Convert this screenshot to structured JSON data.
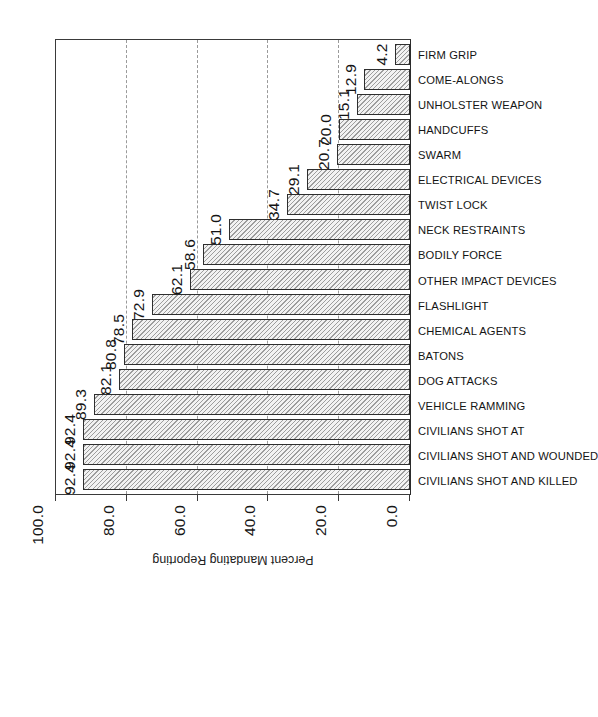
{
  "chart_data": {
    "type": "bar",
    "title": "",
    "subtitle": "",
    "xlabel": "",
    "ylabel": "Percent Mandating Reporting",
    "ylim": [
      0.0,
      100.0
    ],
    "yticks": [
      "0.0",
      "20.0",
      "40.0",
      "60.0",
      "80.0",
      "100.0"
    ],
    "ytick_values": [
      0.0,
      20.0,
      40.0,
      60.0,
      80.0,
      100.0
    ],
    "grid": "horizontal-dashed",
    "gridline_values": [
      20.0,
      40.0,
      60.0,
      80.0
    ],
    "legend": "none",
    "orientation": "page-rotated-90-ccw",
    "categories": [
      "CIVILIANS SHOT AND KILLED",
      "CIVILIANS SHOT AND WOUNDED",
      "CIVILIANS SHOT AT",
      "VEHICLE RAMMING",
      "DOG ATTACKS",
      "BATONS",
      "CHEMICAL AGENTS",
      "FLASHLIGHT",
      "OTHER IMPACT DEVICES",
      "BODILY FORCE",
      "NECK RESTRAINTS",
      "TWIST LOCK",
      "ELECTRICAL DEVICES",
      "SWARM",
      "HANDCUFFS",
      "UNHOLSTER WEAPON",
      "COME-ALONGS",
      "FIRM GRIP"
    ],
    "values": [
      92.4,
      92.4,
      92.4,
      89.3,
      82.1,
      80.8,
      78.5,
      72.9,
      62.1,
      58.6,
      51.0,
      34.7,
      29.1,
      20.7,
      20.0,
      15.1,
      12.9,
      4.2
    ],
    "value_labels": [
      "92.4",
      "92.4",
      "92.4",
      "89.3",
      "82.1",
      "80.8",
      "78.5",
      "72.9",
      "62.1",
      "58.6",
      "51.0",
      "34.7",
      "29.1",
      "20.7",
      "20.0",
      "15.1",
      "12.9",
      "4.2"
    ],
    "bar_fill": "#f2f2f2",
    "bar_hatch": "diagonal",
    "bar_edge": "#2e2e2e",
    "grid_color": "#9a9a9a",
    "axis_color": "#3a3a3a",
    "text_color": "#141414"
  }
}
